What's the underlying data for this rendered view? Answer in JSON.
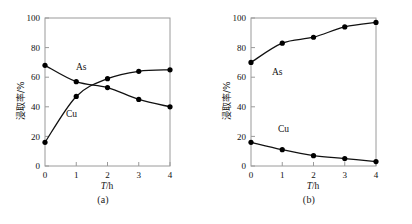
{
  "figure": {
    "panels": [
      {
        "caption": "(a)",
        "xlabel_italic": "T",
        "xlabel_rest": "/h",
        "ylabel": "浸取率/%",
        "series_labels": {
          "as": "As",
          "cu": "Cu"
        }
      },
      {
        "caption": "(b)",
        "xlabel_italic": "T",
        "xlabel_rest": "/h",
        "ylabel": "浸取率/%",
        "series_labels": {
          "as": "As",
          "cu": "Cu"
        }
      }
    ]
  },
  "chart_data": [
    {
      "type": "line",
      "title": "(a)",
      "xlabel": "T/h",
      "ylabel": "浸取率/%",
      "xlim": [
        0,
        4
      ],
      "ylim": [
        0,
        100
      ],
      "xticks": [
        0,
        1,
        2,
        3,
        4
      ],
      "xticklabels": [
        "0",
        "1",
        "2",
        "3",
        "4"
      ],
      "yticks": [
        0,
        20,
        40,
        60,
        80,
        100
      ],
      "yticklabels": [
        "0",
        "20",
        "40",
        "60",
        "80",
        "100"
      ],
      "grid": false,
      "legend": "inline-annotations",
      "x": [
        0,
        1,
        2,
        3,
        4
      ],
      "series": [
        {
          "name": "As",
          "values": [
            68,
            57,
            53,
            45,
            40
          ],
          "marker": "filled-circle"
        },
        {
          "name": "Cu",
          "values": [
            16,
            47,
            59,
            64,
            65
          ],
          "marker": "filled-circle"
        }
      ]
    },
    {
      "type": "line",
      "title": "(b)",
      "xlabel": "T/h",
      "ylabel": "浸取率/%",
      "xlim": [
        0,
        4
      ],
      "ylim": [
        0,
        100
      ],
      "xticks": [
        0,
        1,
        2,
        3,
        4
      ],
      "xticklabels": [
        "0",
        "1",
        "2",
        "3",
        "4"
      ],
      "yticks": [
        0,
        20,
        40,
        60,
        80,
        100
      ],
      "yticklabels": [
        "0",
        "20",
        "40",
        "60",
        "80",
        "100"
      ],
      "grid": false,
      "legend": "inline-annotations",
      "x": [
        0,
        1,
        2,
        3,
        4
      ],
      "series": [
        {
          "name": "As",
          "values": [
            70,
            83,
            87,
            94,
            97
          ],
          "marker": "filled-circle"
        },
        {
          "name": "Cu",
          "values": [
            16,
            11,
            7,
            5,
            3
          ],
          "marker": "filled-circle"
        }
      ]
    }
  ],
  "style": {
    "line_color": "#111111",
    "marker_color": "#000000",
    "axis_color": "#9a9a9a",
    "background": "#ffffff"
  }
}
